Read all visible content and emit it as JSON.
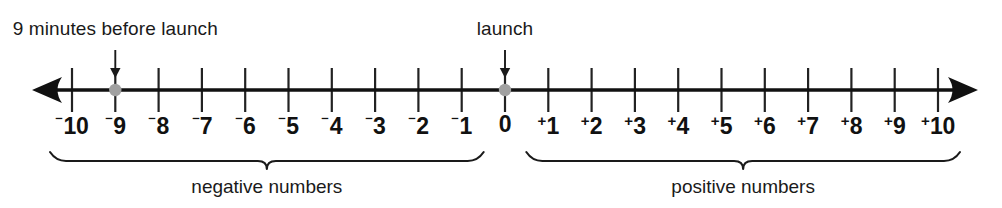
{
  "figure": {
    "colors": {
      "line": "#111111",
      "tick": "#222222",
      "marker": "#a0a0a0",
      "text": "#1a1a1a",
      "background": "#ffffff"
    }
  },
  "chart_data": {
    "type": "number-line",
    "title": "",
    "xlabel": "",
    "ylabel": "",
    "xlim": [
      -10,
      10
    ],
    "grid": false,
    "tick_step": 1,
    "zero_position": 0,
    "ticks": [
      {
        "value": -10,
        "label": "10",
        "sign": "⁻"
      },
      {
        "value": -9,
        "label": "9",
        "sign": "⁻"
      },
      {
        "value": -8,
        "label": "8",
        "sign": "⁻"
      },
      {
        "value": -7,
        "label": "7",
        "sign": "⁻"
      },
      {
        "value": -6,
        "label": "6",
        "sign": "⁻"
      },
      {
        "value": -5,
        "label": "5",
        "sign": "⁻"
      },
      {
        "value": -4,
        "label": "4",
        "sign": "⁻"
      },
      {
        "value": -3,
        "label": "3",
        "sign": "⁻"
      },
      {
        "value": -2,
        "label": "2",
        "sign": "⁻"
      },
      {
        "value": -1,
        "label": "1",
        "sign": "⁻"
      },
      {
        "value": 0,
        "label": "0",
        "sign": ""
      },
      {
        "value": 1,
        "label": "1",
        "sign": "+"
      },
      {
        "value": 2,
        "label": "2",
        "sign": "+"
      },
      {
        "value": 3,
        "label": "3",
        "sign": "+"
      },
      {
        "value": 4,
        "label": "4",
        "sign": "+"
      },
      {
        "value": 5,
        "label": "5",
        "sign": "+"
      },
      {
        "value": 6,
        "label": "6",
        "sign": "+"
      },
      {
        "value": 7,
        "label": "7",
        "sign": "+"
      },
      {
        "value": 8,
        "label": "8",
        "sign": "+"
      },
      {
        "value": 9,
        "label": "9",
        "sign": "+"
      },
      {
        "value": 10,
        "label": "10",
        "sign": "+"
      }
    ],
    "markers": [
      {
        "value": -9,
        "name": "nine-minutes-before-launch",
        "color": "#a0a0a0"
      },
      {
        "value": 0,
        "name": "launch",
        "color": "#a0a0a0"
      }
    ],
    "annotations": [
      {
        "text": "9 minutes before launch",
        "points_to": -9
      },
      {
        "text": "launch",
        "points_to": 0
      }
    ],
    "braces": [
      {
        "text": "negative numbers",
        "from": -10,
        "to": -1
      },
      {
        "text": "positive numbers",
        "from": 1,
        "to": 10
      }
    ]
  }
}
